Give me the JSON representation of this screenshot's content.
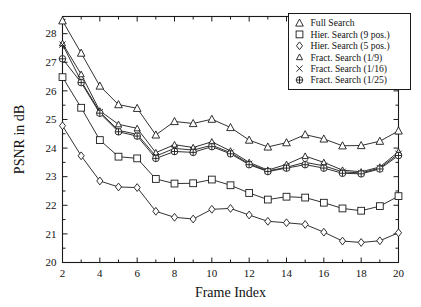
{
  "chart_data": {
    "type": "line",
    "title": "",
    "xlabel": "Frame Index",
    "ylabel": "PSNR in dB",
    "xlim": [
      2,
      20
    ],
    "ylim": [
      20,
      28.6
    ],
    "grid": false,
    "legend_position": "top-right",
    "x": [
      2,
      3,
      4,
      5,
      6,
      7,
      8,
      9,
      10,
      11,
      12,
      13,
      14,
      15,
      16,
      17,
      18,
      19,
      20
    ],
    "xticks": [
      2,
      4,
      6,
      8,
      10,
      12,
      14,
      16,
      18,
      20
    ],
    "xtick_labels": [
      "2",
      "4",
      "6",
      "8",
      "10",
      "12",
      "14",
      "16",
      "18",
      "20"
    ],
    "yticks": [
      20,
      21,
      22,
      23,
      24,
      25,
      26,
      27,
      28
    ],
    "ytick_labels": [
      "20",
      "21",
      "22",
      "23",
      "24",
      "25",
      "26",
      "27",
      "28"
    ],
    "series": [
      {
        "name": "Full Search",
        "marker": "triangle-up",
        "values": [
          28.45,
          27.32,
          26.17,
          25.52,
          25.39,
          24.46,
          24.93,
          24.86,
          25.01,
          24.72,
          24.28,
          24.04,
          24.19,
          24.47,
          24.32,
          24.08,
          24.09,
          24.24,
          24.6
        ]
      },
      {
        "name": "Hier. Search (9 pos.)",
        "marker": "square",
        "values": [
          26.48,
          25.41,
          24.28,
          23.7,
          23.64,
          22.92,
          22.76,
          22.77,
          22.9,
          22.7,
          22.43,
          22.2,
          22.3,
          22.27,
          22.09,
          21.89,
          21.81,
          21.97,
          22.32
        ]
      },
      {
        "name": "Hier. Search (5 pos.)",
        "marker": "diamond",
        "values": [
          24.78,
          23.73,
          22.85,
          22.64,
          22.62,
          21.79,
          21.58,
          21.52,
          21.86,
          21.89,
          21.66,
          21.44,
          21.39,
          21.33,
          21.06,
          20.75,
          20.7,
          20.76,
          21.04
        ]
      },
      {
        "name": "Fract. Search (1/9)",
        "marker": "triangle-small",
        "values": [
          27.66,
          26.58,
          25.3,
          24.83,
          24.69,
          23.84,
          24.12,
          24.02,
          24.22,
          23.9,
          23.5,
          23.23,
          23.43,
          23.72,
          23.5,
          23.23,
          23.17,
          23.34,
          23.87
        ]
      },
      {
        "name": "Fract. Search (1/16)",
        "marker": "cross",
        "values": [
          27.62,
          26.34,
          25.26,
          24.62,
          24.48,
          23.72,
          23.99,
          23.93,
          24.1,
          23.84,
          23.45,
          23.2,
          23.33,
          23.5,
          23.38,
          23.17,
          23.13,
          23.3,
          23.8
        ]
      },
      {
        "name": "Fract. Search (1/25)",
        "marker": "circle-plus",
        "values": [
          27.12,
          26.29,
          25.22,
          24.57,
          24.42,
          23.64,
          23.88,
          23.85,
          24.05,
          23.8,
          23.42,
          23.18,
          23.3,
          23.42,
          23.3,
          23.12,
          23.1,
          23.27,
          23.74
        ]
      }
    ]
  },
  "legend": {
    "entries": [
      {
        "label": "Full Search"
      },
      {
        "label": "Hier. Search (9 pos.)"
      },
      {
        "label": "Hier. Search (5 pos.)"
      },
      {
        "label": "Fract. Search (1/9)"
      },
      {
        "label": "Fract. Search (1/16)"
      },
      {
        "label": "Fract. Search (1/25)"
      }
    ]
  },
  "colors": {
    "ink": "#1a1a1a",
    "background": "#ffffff"
  }
}
